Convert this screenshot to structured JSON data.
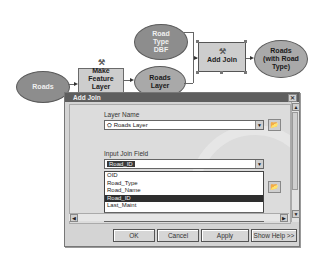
{
  "diagram": {
    "nodes": {
      "roads": "Roads",
      "make_feature_layer": "Make Feature Layer",
      "roads_layer": "Roads Layer",
      "road_type_dbf": "Road Type DBF",
      "add_join": "Add Join",
      "roads_with_road_type": "Roads (with Road Type)"
    }
  },
  "dialog": {
    "title": "Add Join",
    "close_icon": "✕",
    "layer_name_label": "Layer Name",
    "layer_name_value": "Roads Layer",
    "input_join_field_label": "Input Join Field",
    "input_join_field_value": "Road_ID",
    "dropdown_options": [
      "OID",
      "Road_Type",
      "Road_Name",
      "Road_ID",
      "Last_Maint"
    ],
    "selected_option_index": 3,
    "output_join_field_value": "Road_ID",
    "buttons": {
      "ok": "OK",
      "cancel": "Cancel",
      "apply": "Apply",
      "show_help": "Show Help >>"
    }
  }
}
